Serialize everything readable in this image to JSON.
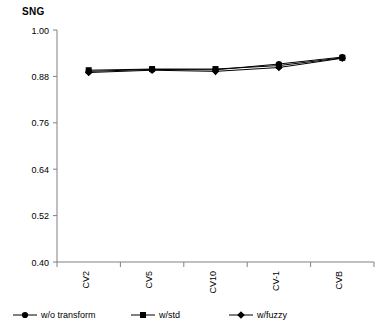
{
  "chart_data": {
    "type": "line",
    "title": "SNG",
    "xlabel": "",
    "ylabel": "",
    "categories": [
      "CV2",
      "CV5",
      "CV10",
      "CV-1",
      "CVB"
    ],
    "ylim": [
      0.4,
      1.0
    ],
    "yticks": [
      "1.00",
      "0.88",
      "0.76",
      "0.64",
      "0.52",
      "0.40"
    ],
    "ytick_values": [
      1.0,
      0.88,
      0.76,
      0.64,
      0.52,
      0.4
    ],
    "grid": false,
    "legend_position": "bottom",
    "series": [
      {
        "name": "w/o transform",
        "marker": "circle",
        "values": [
          0.893,
          0.898,
          0.897,
          0.912,
          0.93
        ]
      },
      {
        "name": "w/std",
        "marker": "square",
        "values": [
          0.896,
          0.899,
          0.899,
          0.908,
          0.928
        ]
      },
      {
        "name": "w/fuzzy",
        "marker": "diamond",
        "values": [
          0.89,
          0.896,
          0.893,
          0.903,
          0.927
        ]
      }
    ]
  },
  "legend": {
    "items": [
      {
        "label": "w/o transform",
        "marker": "circle-marker-icon"
      },
      {
        "label": "w/std",
        "marker": "square-marker-icon"
      },
      {
        "label": "w/fuzzy",
        "marker": "diamond-marker-icon"
      }
    ]
  },
  "colors": {
    "series": "#000000",
    "axis": "#808080",
    "text": "#000000",
    "background": "#ffffff"
  }
}
